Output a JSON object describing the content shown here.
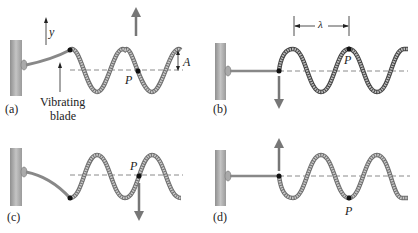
{
  "figure": {
    "colors": {
      "wave_fill": "#bdbdbd",
      "wave_outline": "#6e6e6e",
      "wall": "#a9a9a9",
      "arrow": "#777777",
      "dashed_line": "#8a8a8a",
      "dot": "#111111",
      "text": "#222222"
    },
    "panels": [
      {
        "id": "a",
        "label": "(a)",
        "point_label": "P",
        "axis_label": "y",
        "amplitude_label": "A",
        "blade_label_line1": "Vibrating",
        "blade_label_line2": "blade",
        "arrow_direction": "up"
      },
      {
        "id": "b",
        "label": "(b)",
        "point_label": "P",
        "wavelength_label": "λ",
        "arrow_direction": "down"
      },
      {
        "id": "c",
        "label": "(c)",
        "point_label": "P",
        "arrow_direction": "down"
      },
      {
        "id": "d",
        "label": "(d)",
        "point_label": "P",
        "arrow_direction": "up"
      }
    ]
  }
}
